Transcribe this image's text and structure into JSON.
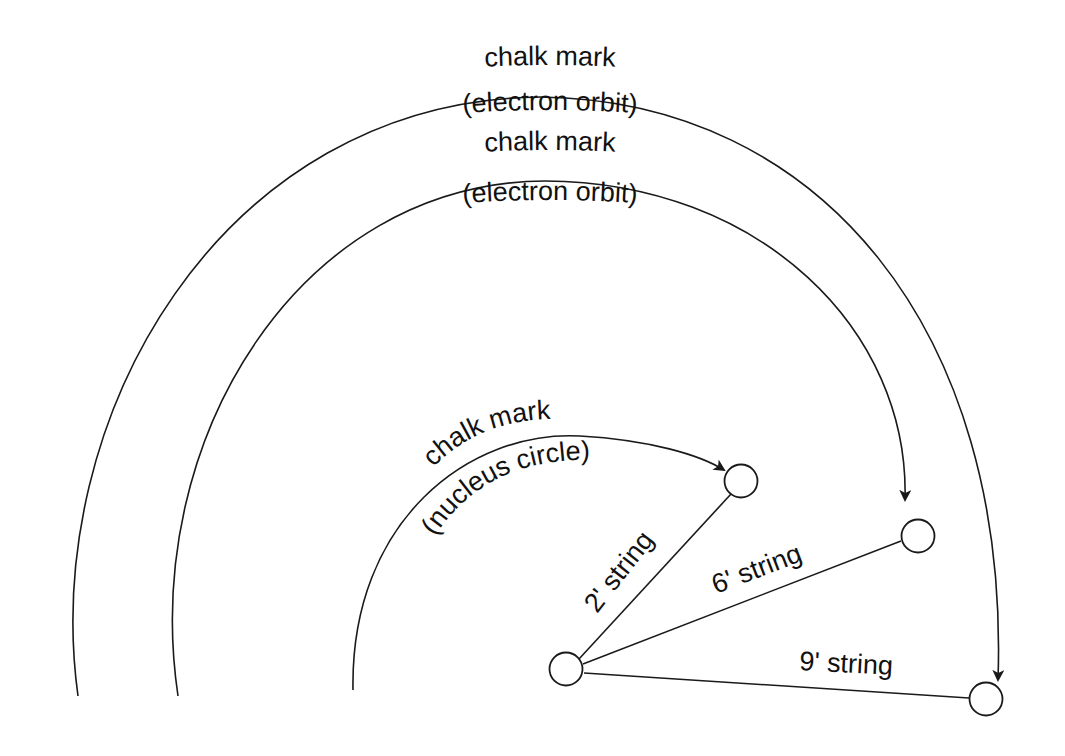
{
  "diagram": {
    "type": "atom-model-floor-layout",
    "colors": {
      "ink": "#1a1a1a",
      "background": "#ffffff"
    },
    "labels": {
      "outer_orbit_top": "chalk mark",
      "outer_orbit_bottom": "(electron orbit)",
      "inner_orbit_top": "chalk mark",
      "inner_orbit_bottom": "(electron orbit)",
      "nucleus_top": "chalk mark",
      "nucleus_bottom": "(nucleus circle)"
    },
    "strings": [
      {
        "id": "string-2",
        "label": "2' string"
      },
      {
        "id": "string-6",
        "label": "6' string"
      },
      {
        "id": "string-9",
        "label": "9' string"
      }
    ],
    "nodes": [
      {
        "id": "center",
        "role": "pivot"
      },
      {
        "id": "end-2",
        "role": "nucleus marker"
      },
      {
        "id": "end-6",
        "role": "inner orbit marker"
      },
      {
        "id": "end-9",
        "role": "outer orbit marker"
      }
    ]
  }
}
